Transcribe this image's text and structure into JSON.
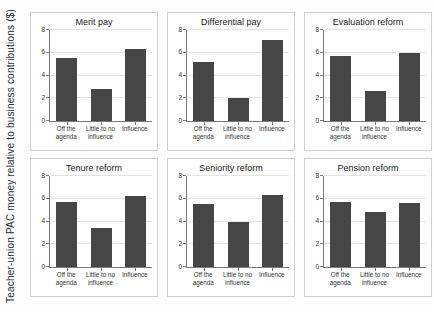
{
  "figure": {
    "ylabel": "Teacher-union PAC money relative to business contributions ($)"
  },
  "colors": {
    "bar": "#464646",
    "panel_border": "#cfcfcf",
    "gridline": "#e4e4e4",
    "axis": "#7a7a7a",
    "text": "#333333"
  },
  "chart_data": [
    {
      "type": "bar",
      "title": "Merit pay",
      "categories": [
        "Off the\nagenda",
        "Little to no\ninfluence",
        "Influence"
      ],
      "values": [
        5.5,
        2.8,
        6.3
      ],
      "xlabel": "",
      "ylabel": "",
      "ylim": [
        0,
        8
      ],
      "yticks": [
        0,
        2,
        4,
        6,
        8
      ],
      "grid": true,
      "legend": false
    },
    {
      "type": "bar",
      "title": "Differential pay",
      "categories": [
        "Off the\nagenda",
        "Little to no\ninfluence",
        "Influence"
      ],
      "values": [
        5.2,
        2.0,
        7.1
      ],
      "xlabel": "",
      "ylabel": "",
      "ylim": [
        0,
        8
      ],
      "yticks": [
        0,
        2,
        4,
        6,
        8
      ],
      "grid": true,
      "legend": false
    },
    {
      "type": "bar",
      "title": "Evaluation reform",
      "categories": [
        "Off the\nagenda",
        "Little to no\ninfluence",
        "Influence"
      ],
      "values": [
        5.7,
        2.6,
        6.0
      ],
      "xlabel": "",
      "ylabel": "",
      "ylim": [
        0,
        8
      ],
      "yticks": [
        0,
        2,
        4,
        6,
        8
      ],
      "grid": true,
      "legend": false
    },
    {
      "type": "bar",
      "title": "Tenure reform",
      "categories": [
        "Off the\nagenda",
        "Little to no\ninfluence",
        "Influence"
      ],
      "values": [
        5.7,
        3.4,
        6.2
      ],
      "xlabel": "",
      "ylabel": "",
      "ylim": [
        0,
        8
      ],
      "yticks": [
        0,
        2,
        4,
        6,
        8
      ],
      "grid": true,
      "legend": false
    },
    {
      "type": "bar",
      "title": "Seniority reform",
      "categories": [
        "Off the\nagenda",
        "Little to no\ninfluence",
        "Influence"
      ],
      "values": [
        5.5,
        4.0,
        6.3
      ],
      "xlabel": "",
      "ylabel": "",
      "ylim": [
        0,
        8
      ],
      "yticks": [
        0,
        2,
        4,
        6,
        8
      ],
      "grid": true,
      "legend": false
    },
    {
      "type": "bar",
      "title": "Pension reform",
      "categories": [
        "Off the\nagenda",
        "Little to no\ninfluence",
        "Influence"
      ],
      "values": [
        5.7,
        4.8,
        5.6
      ],
      "xlabel": "",
      "ylabel": "",
      "ylim": [
        0,
        8
      ],
      "yticks": [
        0,
        2,
        4,
        6,
        8
      ],
      "grid": true,
      "legend": false
    }
  ]
}
